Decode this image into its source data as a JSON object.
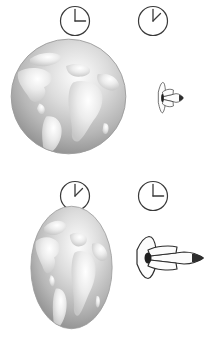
{
  "scene": {
    "title": "Time dilation and length contraction comparison",
    "background_color": "#ffffff",
    "ink_color": "#3a3a3a",
    "globe_land_color": "#e3e3e3",
    "globe_ocean_color": "#b5b5b5",
    "shuttle_body_color": "#fbfbfb",
    "shuttle_outline_color": "#2e2e2e"
  },
  "frames": [
    {
      "id": "earth-rest-frame",
      "name": "Earth rest frame",
      "clock_globe": {
        "name": "earth-clock-top",
        "hour_hand_angle_deg": 0,
        "minute_hand_angle_deg": 90,
        "reading": "3:00",
        "elapsed_label": "full elapsed time"
      },
      "clock_ship": {
        "name": "shuttle-clock-top",
        "hour_hand_angle_deg": 0,
        "minute_hand_angle_deg": 45,
        "reading": "1:30",
        "elapsed_label": "dilated elapsed time"
      },
      "globe": {
        "name": "earth-globe-uncontracted",
        "shape": "sphere",
        "width": 117,
        "height": 117,
        "state_label": "proper length"
      },
      "shuttle": {
        "name": "space-shuttle-contracted",
        "orientation": "nose-right",
        "state_label": "length contracted",
        "scale_x": 0.52,
        "width": 58,
        "height": 56
      }
    },
    {
      "id": "shuttle-rest-frame",
      "name": "Shuttle rest frame",
      "clock_globe": {
        "name": "earth-clock-bottom",
        "hour_hand_angle_deg": 0,
        "minute_hand_angle_deg": 45,
        "reading": "1:30",
        "elapsed_label": "dilated elapsed time"
      },
      "clock_ship": {
        "name": "shuttle-clock-bottom",
        "hour_hand_angle_deg": 0,
        "minute_hand_angle_deg": 90,
        "reading": "3:00",
        "elapsed_label": "full elapsed time"
      },
      "globe": {
        "name": "earth-globe-contracted",
        "shape": "ellipse",
        "width": 83,
        "height": 125,
        "state_label": "length contracted"
      },
      "shuttle": {
        "name": "space-shuttle-uncontracted",
        "orientation": "nose-right",
        "state_label": "proper length",
        "scale_x": 1.0,
        "width": 80,
        "height": 56
      }
    }
  ],
  "icons": {
    "clock": "clock-icon",
    "globe": "globe-icon",
    "shuttle": "space-shuttle-icon"
  }
}
